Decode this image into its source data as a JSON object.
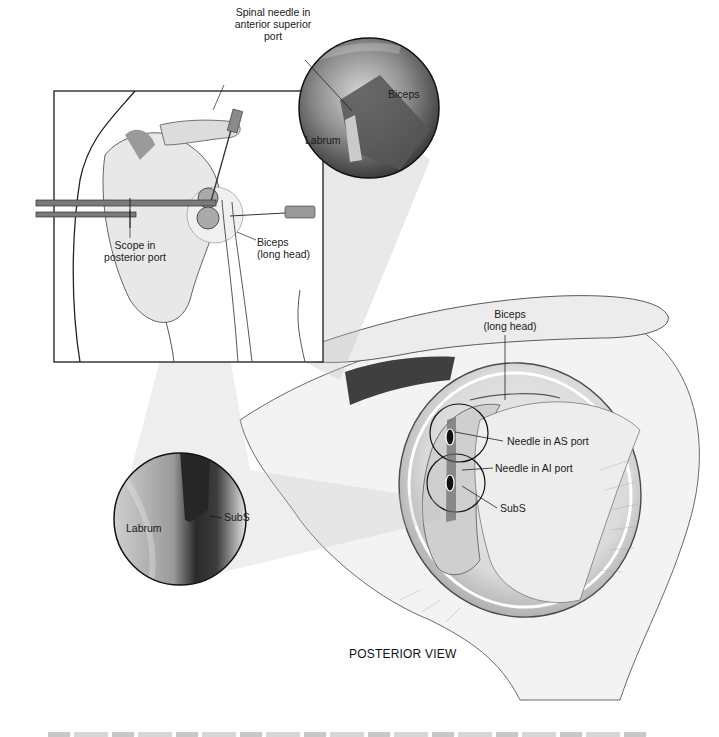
{
  "figure": {
    "view_title": "POSTERIOR VIEW",
    "inset": {
      "labels": {
        "spinal_needle": [
          "Spinal needle in",
          "anterior superior",
          "port"
        ],
        "scope": [
          "Scope in",
          "posterior port"
        ],
        "biceps": [
          "Biceps",
          "(long head)"
        ]
      }
    },
    "scope_view_top": {
      "labels": {
        "biceps": "Biceps",
        "labrum": "Labrum"
      }
    },
    "scope_view_bottom": {
      "labels": {
        "labrum": "Labrum",
        "subs": "SubS"
      }
    },
    "main_anatomy": {
      "labels": {
        "biceps": [
          "Biceps",
          "(long head)"
        ],
        "needle_as": "Needle in AS port",
        "needle_ai": "Needle in AI port",
        "subs": "SubS"
      }
    },
    "caption": "",
    "colors": {
      "ink": "#1a1a1a",
      "skin_light": "#eeeeee",
      "tissue_mid": "#bdbdbd",
      "tissue_dark": "#4a4a4a",
      "scope_dark": "#3a3a3a",
      "beam": "#d9d9d9"
    }
  }
}
